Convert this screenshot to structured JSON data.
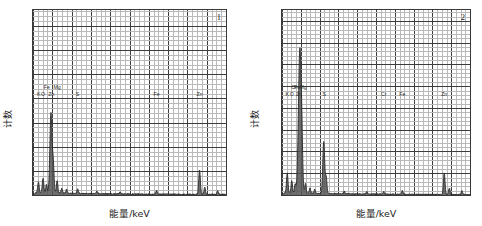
{
  "figure": {
    "type": "eds-spectra-pair",
    "panels": [
      {
        "index_label": "1",
        "xlabel": "能量/keV",
        "ylabel": "计数",
        "xlim": [
          0,
          10
        ],
        "ylim": [
          0,
          383
        ],
        "xticks": [
          "0",
          "2",
          "4",
          "6",
          "8",
          "10"
        ],
        "xtick_values": [
          0,
          2,
          4,
          6,
          8,
          10
        ],
        "yticks": [
          "0",
          "50",
          "100",
          "150",
          "200",
          "250",
          "300",
          "350"
        ],
        "ytick_values": [
          0,
          50,
          100,
          150,
          200,
          250,
          300,
          350
        ],
        "element_labels": [
          {
            "text": "K",
            "x": 0.3,
            "row": 1
          },
          {
            "text": "O",
            "x": 0.52,
            "row": 1
          },
          {
            "text": "Fe",
            "x": 0.72,
            "row": 0
          },
          {
            "text": "Zn",
            "x": 0.95,
            "row": 1
          },
          {
            "text": "Mg",
            "x": 1.25,
            "row": 0
          },
          {
            "text": "S",
            "x": 2.31,
            "row": 1
          },
          {
            "text": "Fe",
            "x": 6.4,
            "row": 1
          },
          {
            "text": "Zn",
            "x": 8.63,
            "row": 1
          }
        ],
        "peaks": [
          {
            "x": 0.28,
            "h": 22
          },
          {
            "x": 0.52,
            "h": 30
          },
          {
            "x": 0.7,
            "h": 18
          },
          {
            "x": 0.93,
            "h": 165
          },
          {
            "x": 1.05,
            "h": 58
          },
          {
            "x": 1.25,
            "h": 26
          },
          {
            "x": 1.49,
            "h": 10
          },
          {
            "x": 1.74,
            "h": 8
          },
          {
            "x": 2.31,
            "h": 9
          },
          {
            "x": 3.31,
            "h": 5
          },
          {
            "x": 4.51,
            "h": 4
          },
          {
            "x": 6.4,
            "h": 7
          },
          {
            "x": 8.63,
            "h": 50
          },
          {
            "x": 8.9,
            "h": 14
          },
          {
            "x": 9.57,
            "h": 7
          }
        ],
        "baseline": 4
      },
      {
        "index_label": "2",
        "xlabel": "能量/keV",
        "ylabel": "计数",
        "xlim": [
          0,
          10
        ],
        "ylim": [
          0,
          425
        ],
        "xticks": [
          "0",
          "2",
          "4",
          "6",
          "8",
          "10"
        ],
        "xtick_values": [
          0,
          2,
          4,
          6,
          8,
          10
        ],
        "yticks": [
          "0",
          "50",
          "100",
          "150",
          "200",
          "250",
          "300",
          "350",
          "400"
        ],
        "ytick_values": [
          0,
          50,
          100,
          150,
          200,
          250,
          300,
          350,
          400
        ],
        "element_labels": [
          {
            "text": "K",
            "x": 0.28,
            "row": 1
          },
          {
            "text": "O",
            "x": 0.52,
            "row": 1
          },
          {
            "text": "Cr",
            "x": 0.64,
            "row": 0
          },
          {
            "text": "Fe",
            "x": 0.8,
            "row": 0
          },
          {
            "text": "Zn",
            "x": 0.9,
            "row": 1
          },
          {
            "text": "Mg",
            "x": 1.12,
            "row": 0
          },
          {
            "text": "S",
            "x": 2.25,
            "row": 1
          },
          {
            "text": "Cr",
            "x": 5.41,
            "row": 1
          },
          {
            "text": "Fe",
            "x": 6.4,
            "row": 1
          },
          {
            "text": "Zn",
            "x": 8.63,
            "row": 1
          }
        ],
        "peaks": [
          {
            "x": 0.28,
            "h": 45
          },
          {
            "x": 0.52,
            "h": 28
          },
          {
            "x": 0.7,
            "h": 20
          },
          {
            "x": 0.95,
            "h": 330
          },
          {
            "x": 1.06,
            "h": 72
          },
          {
            "x": 1.25,
            "h": 22
          },
          {
            "x": 1.49,
            "h": 12
          },
          {
            "x": 1.74,
            "h": 10
          },
          {
            "x": 2.22,
            "h": 120
          },
          {
            "x": 2.35,
            "h": 38
          },
          {
            "x": 3.31,
            "h": 6
          },
          {
            "x": 4.51,
            "h": 5
          },
          {
            "x": 5.41,
            "h": 6
          },
          {
            "x": 6.4,
            "h": 8
          },
          {
            "x": 8.63,
            "h": 50
          },
          {
            "x": 8.9,
            "h": 15
          },
          {
            "x": 9.57,
            "h": 8
          }
        ],
        "baseline": 4
      }
    ]
  }
}
